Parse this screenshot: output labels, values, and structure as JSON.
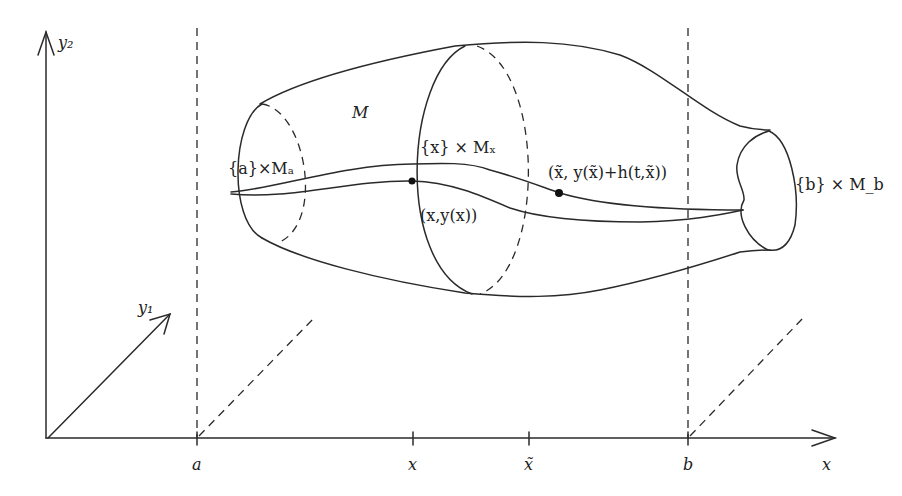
{
  "diagram": {
    "axes": {
      "y2_label": "y₂",
      "y1_label": "y₁",
      "x_label": "x"
    },
    "ticks": [
      {
        "id": "a",
        "label": "a"
      },
      {
        "id": "x",
        "label": "x"
      },
      {
        "id": "xtilde",
        "label": "x̃"
      },
      {
        "id": "b",
        "label": "b"
      }
    ],
    "labels": {
      "manifold": "M",
      "fiber_a": "{a}×Mₐ",
      "fiber_x": "{x} × Mₓ",
      "fiber_b": "{b} × M_b",
      "point_curve": "(x,y(x))",
      "point_perturbed": "(x̃, y(x̃)+h(t,x̃))"
    },
    "colors": {
      "line": "#2a2a2a",
      "background": "#ffffff"
    }
  }
}
